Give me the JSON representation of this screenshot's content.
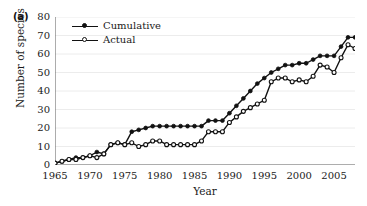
{
  "figure": {
    "panel_label": "(a)",
    "xlabel": "Year",
    "ylabel": "Number of species"
  },
  "legend": {
    "entries": [
      {
        "label": "Cumulative",
        "marker": "filled-circle",
        "color": "#111111"
      },
      {
        "label": "Actual",
        "marker": "open-circle",
        "color": "#111111"
      }
    ]
  },
  "axes": {
    "y_ticks": [
      "80",
      "70",
      "60",
      "50",
      "40",
      "30",
      "20",
      "10",
      "0"
    ],
    "x_ticks": [
      "1965",
      "1970",
      "1975",
      "1980",
      "1985",
      "1990",
      "1995",
      "2000",
      "2005"
    ]
  },
  "chart_data": {
    "type": "line",
    "title": "",
    "xlabel": "Year",
    "ylabel": "Number of species",
    "xlim": [
      1965,
      2008
    ],
    "ylim": [
      0,
      80
    ],
    "grid": true,
    "legend_position": "top-left",
    "x": [
      1965,
      1966,
      1967,
      1968,
      1969,
      1970,
      1971,
      1972,
      1973,
      1974,
      1975,
      1976,
      1977,
      1978,
      1979,
      1980,
      1981,
      1982,
      1983,
      1984,
      1985,
      1986,
      1987,
      1988,
      1989,
      1990,
      1991,
      1992,
      1993,
      1994,
      1995,
      1996,
      1997,
      1998,
      1999,
      2000,
      2001,
      2002,
      2003,
      2004,
      2005,
      2006,
      2007,
      2008
    ],
    "series": [
      {
        "name": "Cumulative",
        "marker": "filled-circle",
        "color": "#111111",
        "values": [
          1,
          2,
          3,
          4,
          4,
          5,
          7,
          6,
          11,
          12,
          11,
          18,
          19,
          20,
          21,
          21,
          21,
          21,
          21,
          21,
          21,
          21,
          24,
          24,
          24,
          28,
          32,
          36,
          40,
          44,
          47,
          50,
          52,
          54,
          54,
          55,
          55,
          57,
          59,
          59,
          59,
          64,
          69,
          69
        ]
      },
      {
        "name": "Actual",
        "marker": "open-circle",
        "color": "#111111",
        "values": [
          1,
          2,
          3,
          3,
          4,
          5,
          4,
          6,
          11,
          12,
          11,
          12,
          10,
          11,
          13,
          13,
          11,
          11,
          11,
          11,
          11,
          13,
          18,
          18,
          18,
          23,
          26,
          29,
          31,
          33,
          35,
          45,
          47,
          47,
          45,
          46,
          45,
          48,
          54,
          53,
          50,
          58,
          65,
          63
        ]
      }
    ]
  }
}
